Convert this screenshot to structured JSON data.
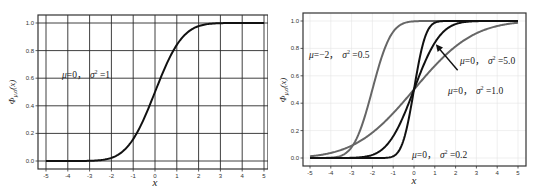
{
  "chart_data": [
    {
      "type": "line",
      "title": "",
      "xlabel": "x",
      "ylabel": "Φμ,σ(x)",
      "xlim": [
        -5,
        5
      ],
      "ylim": [
        0,
        1
      ],
      "grid": true,
      "x_ticks": [
        "-5",
        "-4",
        "-3",
        "-2",
        "-1",
        "0",
        "1",
        "2",
        "3",
        "4",
        "5"
      ],
      "y_ticks": [
        "0.0",
        "0.2",
        "0.4",
        "0.6",
        "0.8",
        "1.0"
      ],
      "annotations": [
        {
          "text_mu": "μ=0，",
          "text_sigma": "σ² =1",
          "x": -4,
          "y": 0.65
        }
      ],
      "series": [
        {
          "name": "μ=0, σ²=1",
          "mu": 0,
          "sigma2": 1,
          "color": "#111111",
          "x": [
            -5,
            -4,
            -3,
            -2.5,
            -2,
            -1.5,
            -1,
            -0.5,
            0,
            0.5,
            1,
            1.5,
            2,
            2.5,
            3,
            4,
            5
          ],
          "y": [
            0.0,
            0.0,
            0.001,
            0.006,
            0.023,
            0.067,
            0.159,
            0.309,
            0.5,
            0.691,
            0.841,
            0.933,
            0.977,
            0.994,
            0.999,
            1.0,
            1.0
          ]
        }
      ]
    },
    {
      "type": "line",
      "title": "",
      "xlabel": "x",
      "ylabel": "Φμ,σ(x)",
      "xlim": [
        -5,
        5
      ],
      "ylim": [
        0,
        1
      ],
      "grid": true,
      "x_ticks": [
        "-5",
        "-4",
        "-3",
        "-2",
        "-1",
        "0",
        "1",
        "2",
        "3",
        "4",
        "5"
      ],
      "y_ticks": [
        "0.0",
        "0.2",
        "0.4",
        "0.6",
        "0.8",
        "1.0"
      ],
      "annotations": [
        {
          "text_mu": "μ=−2，",
          "text_sigma": "σ² =0.5",
          "x": -4.8,
          "y": 0.75
        },
        {
          "text_mu": "μ=0，",
          "text_sigma": "σ² =5.0",
          "x": 2.2,
          "y": 0.7
        },
        {
          "text_mu": "μ=0，",
          "text_sigma": "σ² =1.0",
          "x": 1.6,
          "y": 0.5
        },
        {
          "text_mu": "μ=0，",
          "text_sigma": "σ² =0.2",
          "x": -0.2,
          "y": 0.03
        }
      ],
      "arrow": {
        "from": [
          2.1,
          0.64
        ],
        "to": [
          1.05,
          0.83
        ]
      },
      "series": [
        {
          "name": "μ=−2, σ²=0.5",
          "mu": -2,
          "sigma2": 0.5,
          "color": "#666666"
        },
        {
          "name": "μ=0, σ²=5.0",
          "mu": 0,
          "sigma2": 5.0,
          "color": "#666666"
        },
        {
          "name": "μ=0, σ²=1.0",
          "mu": 0,
          "sigma2": 1.0,
          "color": "#111111"
        },
        {
          "name": "μ=0, σ²=0.2",
          "mu": 0,
          "sigma2": 0.2,
          "color": "#111111"
        }
      ]
    }
  ],
  "left": {
    "xlabel": "x",
    "ylabel_main": "Φ",
    "ylabel_sub": "μ,σ",
    "ylabel_arg": "(x)",
    "annotation_mu": "μ=0，",
    "annotation_sigma": "σ",
    "annotation_sup": "2",
    "annotation_val": " =1"
  },
  "right": {
    "xlabel": "x",
    "ylabel_main": "Φ",
    "ylabel_sub": "μ,σ",
    "ylabel_arg": "(x)",
    "annotations": [
      {
        "mu": "μ=−2，",
        "sigma": "σ",
        "sup": "2",
        "val": " =0.5"
      },
      {
        "mu": "μ=0，",
        "sigma": "σ",
        "sup": "2",
        "val": " =5.0"
      },
      {
        "mu": "μ=0，",
        "sigma": "σ",
        "sup": "2",
        "val": " =1.0"
      },
      {
        "mu": "μ=0，",
        "sigma": "σ",
        "sup": "2",
        "val": " =0.2"
      }
    ]
  }
}
